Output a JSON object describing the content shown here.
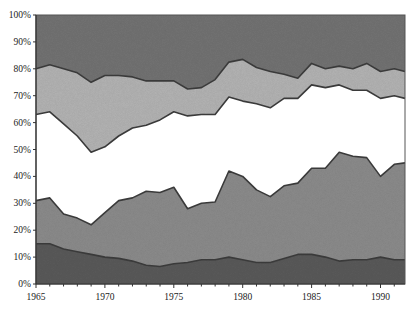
{
  "chart_data": {
    "type": "area",
    "stacked": true,
    "normalized_percent": true,
    "title": "",
    "xlabel": "",
    "ylabel": "",
    "x": [
      1965,
      1966,
      1967,
      1968,
      1969,
      1970,
      1971,
      1972,
      1973,
      1974,
      1975,
      1976,
      1977,
      1978,
      1979,
      1980,
      1981,
      1982,
      1983,
      1984,
      1985,
      1986,
      1987,
      1988,
      1989,
      1990,
      1991,
      1992
    ],
    "xlim": [
      1965,
      1992
    ],
    "ylim": [
      0,
      100
    ],
    "x_ticks": [
      "1965",
      "1970",
      "1975",
      "1980",
      "1985",
      "1990"
    ],
    "x_tick_values": [
      1965,
      1970,
      1975,
      1980,
      1985,
      1990
    ],
    "y_ticks": [
      "0%",
      "10%",
      "20%",
      "30%",
      "40%",
      "50%",
      "60%",
      "70%",
      "80%",
      "90%",
      "100%"
    ],
    "y_tick_values": [
      0,
      10,
      20,
      30,
      40,
      50,
      60,
      70,
      80,
      90,
      100
    ],
    "grid": false,
    "legend": null,
    "series": [
      {
        "name": "Layer 1 (bottom, dark gray)",
        "color": "#5a5a5a",
        "values": [
          15,
          15,
          13,
          12,
          11,
          10,
          9.5,
          8.5,
          7,
          6.5,
          7.5,
          8,
          9,
          9,
          10,
          9,
          8,
          8,
          9.5,
          11,
          11,
          10,
          8.5,
          9,
          9,
          10,
          9,
          9
        ]
      },
      {
        "name": "Layer 2 (medium gray)",
        "color": "#8c8c8c",
        "values": [
          16,
          17,
          13,
          12.5,
          11,
          16.5,
          21.5,
          23.5,
          27.5,
          27.5,
          28.5,
          20,
          21,
          21.5,
          32,
          31,
          27,
          24.5,
          27,
          26.5,
          32,
          33,
          40.5,
          38.5,
          38,
          30,
          35.5,
          36
        ]
      },
      {
        "name": "Layer 3 (white)",
        "color": "#ffffff",
        "values": [
          32,
          32,
          33.5,
          30.5,
          27,
          24.5,
          24,
          26,
          24.5,
          27,
          28,
          34.5,
          33,
          32.5,
          27.5,
          28,
          32,
          33,
          32.5,
          31.5,
          31,
          30,
          25,
          24.5,
          25,
          29,
          25.5,
          24
        ]
      },
      {
        "name": "Layer 4 (light gray)",
        "color": "#b4b4b4",
        "values": [
          17,
          17.5,
          20.5,
          23.5,
          26,
          26.5,
          22.5,
          19,
          16.5,
          14.5,
          11.5,
          10,
          10,
          13,
          13,
          15.5,
          13.5,
          13.5,
          9,
          7.5,
          8,
          7,
          7,
          8,
          10,
          10,
          10,
          10
        ]
      },
      {
        "name": "Layer 5 (top, dark gray)",
        "color": "#737373",
        "values": [
          20,
          18.5,
          20,
          21.5,
          25,
          22.5,
          22.5,
          23,
          24.5,
          24.5,
          24.5,
          27.5,
          27,
          24,
          17.5,
          16.5,
          19.5,
          21,
          22,
          23.5,
          18,
          20,
          19,
          20,
          18,
          21,
          20,
          21
        ]
      }
    ],
    "boundary_line_color": "#3a3a3a"
  }
}
